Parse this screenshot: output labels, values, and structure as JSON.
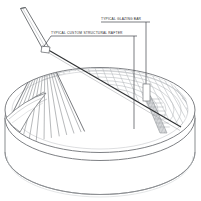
{
  "drawing": {
    "title": "Architectural axonometric of circular glazed roof over cylindrical drum",
    "background_color": "#ffffff",
    "line_color": "#6f7276",
    "grid_color": "#b9bcc0",
    "accent_color": "#2b2b2b",
    "shade_color": "#c8cacd"
  },
  "annotations": [
    {
      "id": "glazing-bar",
      "label": "TYPICAL GLAZING BAR",
      "leader": {
        "x1": 146,
        "y1": 22,
        "x2": 146,
        "y2": 84
      },
      "callout_box": {
        "x": 143,
        "y": 84,
        "width": 7,
        "height": 17
      }
    },
    {
      "id": "structural-rafter",
      "label": "TYPICAL CUSTOM STRUCTURAL RAFTER",
      "leader": {
        "x1": 134,
        "y1": 36,
        "x2": 134,
        "y2": 129
      },
      "hook": {
        "x1": 51,
        "y1": 36,
        "x2": 45,
        "y2": 45
      }
    }
  ],
  "geometry": {
    "drum": {
      "center_x": 100,
      "top_ellipse_cy": 110,
      "rim_ellipse_cy": 118,
      "bottom_ellipse_cy": 162,
      "rx": 96,
      "ry": 43
    },
    "node": {
      "x": 45,
      "y": 48
    },
    "mast": {
      "tip_x": 22,
      "tip_y": 9,
      "base_x": 45,
      "base_y": 48
    },
    "valley_end": {
      "x": 180,
      "y": 126
    },
    "glazing_grid": {
      "rafter_count": 26,
      "purlin_count": 13
    }
  }
}
